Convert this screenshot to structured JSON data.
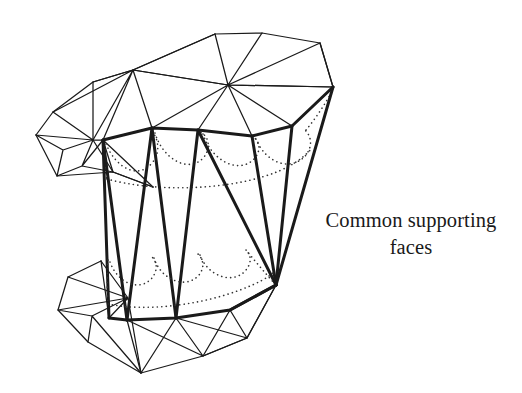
{
  "figure": {
    "type": "geometric-diagram",
    "background_color": "#ffffff",
    "stroke_color": "#1a1a1a",
    "thin_stroke_width": 1.25,
    "bold_stroke_width": 3.0,
    "hidden_stroke_color": "#333333",
    "hidden_dash": "0.1 4.4",
    "annotation": {
      "text": "Common supporting\nfaces",
      "line1": "Common supporting",
      "line2": "faces",
      "color": "#191919",
      "x": 311,
      "y": 207
    },
    "vertices": {
      "u1": [
        228,
        85
      ],
      "u2": [
        333,
        87
      ],
      "u3": [
        320,
        43
      ],
      "u4": [
        262,
        33
      ],
      "u5": [
        215,
        34
      ],
      "u6": [
        133,
        70
      ],
      "u7": [
        93,
        82
      ],
      "u8": [
        53,
        112
      ],
      "u9": [
        36,
        135
      ],
      "u10": [
        63,
        150
      ],
      "u11": [
        93,
        140
      ],
      "u12": [
        103,
        140
      ],
      "u13": [
        152,
        128
      ],
      "u14": [
        198,
        130
      ],
      "u15": [
        252,
        136
      ],
      "u16": [
        292,
        126
      ],
      "u17": [
        57,
        176
      ],
      "u18": [
        113,
        172
      ],
      "u19": [
        153,
        187
      ],
      "u20": [
        82,
        166
      ]
    },
    "support_vertices": {
      "sLeftTop": [
        103,
        140
      ],
      "sTopA": [
        152,
        128
      ],
      "sTopB": [
        198,
        130
      ],
      "sTopC": [
        252,
        136
      ],
      "sRight": [
        333,
        87
      ],
      "sApex": [
        276,
        285
      ],
      "sBotA": [
        127,
        320
      ],
      "sBotB": [
        176,
        318
      ],
      "sBotC": [
        230,
        310
      ],
      "sLeftBot": [
        109,
        318
      ]
    },
    "lower_vertices": {
      "l1": [
        109,
        318
      ],
      "l2": [
        127,
        320
      ],
      "l3": [
        176,
        318
      ],
      "l4": [
        230,
        310
      ],
      "l5": [
        276,
        285
      ],
      "l6": [
        247,
        338
      ],
      "l7": [
        203,
        356
      ],
      "l8": [
        141,
        373
      ],
      "l9": [
        88,
        342
      ],
      "l10": [
        58,
        310
      ],
      "l11": [
        68,
        277
      ],
      "l12": [
        101,
        261
      ],
      "l13": [
        128,
        298
      ],
      "l14": [
        92,
        316
      ]
    },
    "hidden_scallops": [
      {
        "region": "upper",
        "y_base": 175,
        "label": "upper-hidden-rim"
      },
      {
        "region": "lower",
        "y_base": 290,
        "label": "lower-hidden-rim"
      }
    ]
  }
}
